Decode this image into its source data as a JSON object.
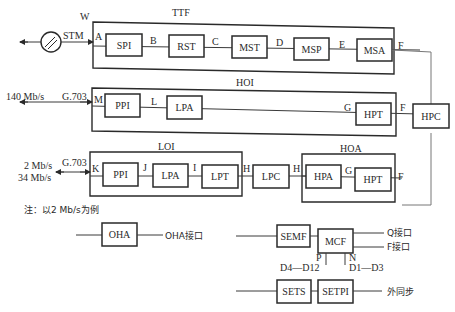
{
  "diagram": {
    "title_note": "注：以2 Mb/s为例",
    "groups": {
      "ttf": {
        "label": "TTF",
        "corner_label": "W"
      },
      "hoi": {
        "label": "HOI"
      },
      "loi": {
        "label": "LOI"
      },
      "hoa": {
        "label": "HOA"
      }
    },
    "blocks": {
      "spi": "SPI",
      "rst": "RST",
      "mst": "MST",
      "msp": "MSP",
      "msa": "MSA",
      "hoi_ppi": "PPI",
      "hoi_lpa": "LPA",
      "hoi_hpt": "HPT",
      "hpc": "HPC",
      "loi_ppi": "PPI",
      "loi_lpa": "LPA",
      "loi_lpt": "LPT",
      "lpc": "LPC",
      "hpa": "HPA",
      "hoa_hpt": "HPT",
      "oha": "OHA",
      "semf": "SEMF",
      "mcf": "MCF",
      "sets": "SETS",
      "setpi": "SETPI"
    },
    "ref_points": {
      "a": "A",
      "b": "B",
      "c": "C",
      "d": "D",
      "e": "E",
      "f_ttf": "F",
      "m": "M",
      "l": "L",
      "g_hoi": "G",
      "f_hoi": "F",
      "k": "K",
      "j": "J",
      "i": "I",
      "h1": "H",
      "h2": "H",
      "g_hoa": "G",
      "f_hoa": "F",
      "p": "P",
      "n": "N"
    },
    "signals": {
      "stm": "STM",
      "rate_140": "140 Mb/s",
      "g703_hoi": "G.703",
      "rate_2": "2 Mb/s",
      "rate_34": "34 Mb/s",
      "g703_loi": "G.703",
      "oha_if": "OHA接口",
      "q_if": "Q接口",
      "f_if": "F接口",
      "d4_d12": "D4—D12",
      "d1_d3": "D1—D3",
      "ext_sync": "外同步"
    }
  }
}
